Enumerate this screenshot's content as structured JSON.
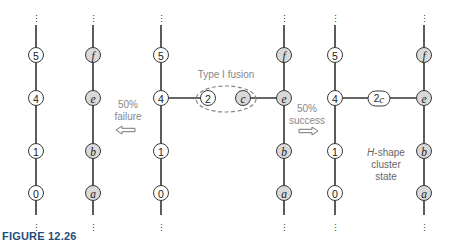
{
  "figure": {
    "caption": "FIGURE 12.26",
    "colors": {
      "node_white": "#ffffff",
      "node_gray": "#d9d9d9",
      "edge": "#333333",
      "annotation": "#888888",
      "caption": "#1f4e78"
    }
  },
  "panels": [
    {
      "name": "after-failure",
      "left_chain": [
        "5",
        "4",
        "1",
        "0"
      ],
      "right_chain": [
        "f",
        "e",
        "b",
        "a"
      ]
    },
    {
      "name": "before-fusion",
      "left_chain": [
        "5",
        "4",
        "1",
        "0"
      ],
      "right_chain": [
        "f",
        "e",
        "b",
        "a"
      ],
      "fusion_nodes": [
        "2",
        "c"
      ],
      "fusion_label": "Type I fusion"
    },
    {
      "name": "after-success",
      "left_chain": [
        "5",
        "4",
        "1",
        "0"
      ],
      "right_chain": [
        "f",
        "e",
        "b",
        "a"
      ],
      "bridge_node": "2c",
      "state_label": {
        "line1_italic": "H",
        "line1_rest": "-shape",
        "line2": "cluster",
        "line3": "state"
      }
    }
  ],
  "transitions": {
    "failure": {
      "percent": "50%",
      "label": "failure",
      "direction": "left"
    },
    "success": {
      "percent": "50%",
      "label": "success",
      "direction": "right"
    }
  },
  "ellipsis": "⋮"
}
